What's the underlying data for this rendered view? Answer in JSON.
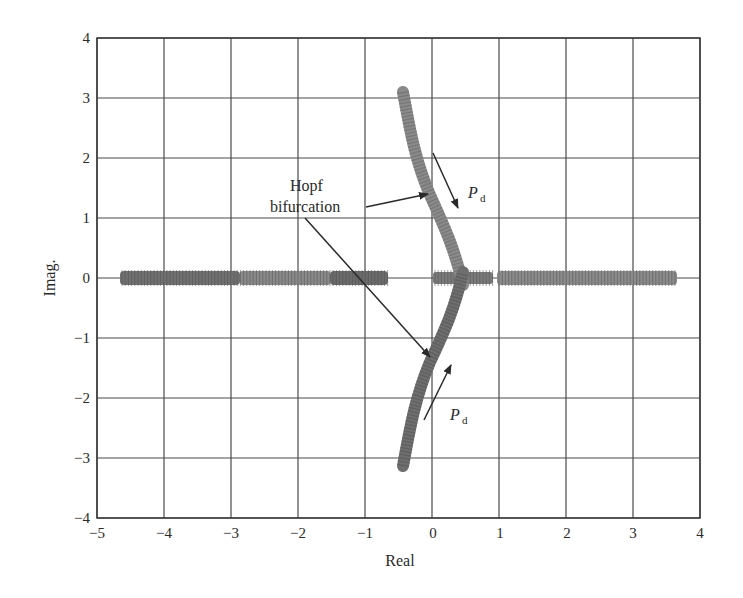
{
  "chart_data": {
    "type": "scatter",
    "title": "",
    "xlabel": "Real",
    "ylabel": "Imag.",
    "xlim": [
      -5,
      4
    ],
    "ylim": [
      -4,
      4
    ],
    "xticks": [
      -5,
      -4,
      -3,
      -2,
      -1,
      0,
      1,
      2,
      3,
      4
    ],
    "yticks": [
      -4,
      -3,
      -2,
      -1,
      0,
      1,
      2,
      3,
      4
    ],
    "grid": true,
    "legend": null,
    "series": [
      {
        "name": "real-axis-left",
        "points": [
          [
            -4.65,
            0
          ],
          [
            -0.7,
            0
          ]
        ],
        "note": "dense eigenvalue markers along real axis"
      },
      {
        "name": "real-axis-center",
        "points": [
          [
            0.0,
            0
          ],
          [
            0.9,
            0
          ]
        ]
      },
      {
        "name": "real-axis-right",
        "points": [
          [
            0.97,
            0
          ],
          [
            3.65,
            0
          ]
        ]
      },
      {
        "name": "upper-branch",
        "points": [
          [
            -0.45,
            3.1
          ],
          [
            -0.23,
            2.1
          ],
          [
            0.0,
            1.4
          ],
          [
            0.25,
            0.75
          ],
          [
            0.45,
            0.15
          ]
        ]
      },
      {
        "name": "lower-branch",
        "points": [
          [
            -0.45,
            -3.1
          ],
          [
            -0.23,
            -2.1
          ],
          [
            0.0,
            -1.4
          ],
          [
            0.25,
            -0.75
          ],
          [
            0.45,
            -0.15
          ]
        ]
      }
    ],
    "annotations": [
      {
        "text": "Hopf bifurcation",
        "arrows_to": [
          [
            0.0,
            1.4
          ],
          [
            0.0,
            -1.4
          ]
        ]
      },
      {
        "text": "P_d",
        "position": [
          0.55,
          1.5
        ],
        "arrow": {
          "from": [
            -0.05,
            2.05
          ],
          "to": [
            0.38,
            1.2
          ]
        }
      },
      {
        "text": "P_d",
        "position": [
          0.28,
          -2.3
        ],
        "arrow": {
          "from": [
            -0.15,
            -2.38
          ],
          "to": [
            0.28,
            -1.42
          ]
        }
      }
    ]
  },
  "labels": {
    "xlabel": "Real",
    "ylabel": "Imag.",
    "hopf_line1": "Hopf",
    "hopf_line2": "bifurcation",
    "pd_main": "P",
    "pd_sub": "d"
  },
  "xticks": [
    "−5",
    "−4",
    "−3",
    "−2",
    "−1",
    "0",
    "1",
    "2",
    "3",
    "4"
  ],
  "yticks": [
    "4",
    "3",
    "2",
    "1",
    "0",
    "−1",
    "−2",
    "−3",
    "−4"
  ]
}
